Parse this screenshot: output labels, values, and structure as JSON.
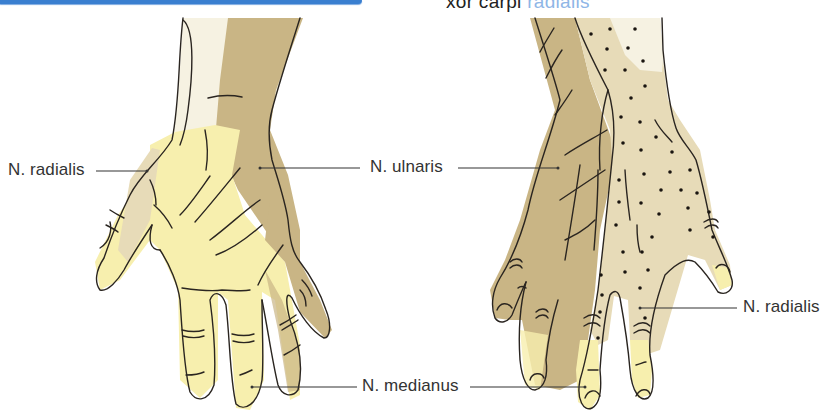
{
  "header": {
    "title_visible": "xor carpi ",
    "title_faded": "radialis"
  },
  "labels": {
    "left_radialis": "N. radialis",
    "ulnaris": "N. ulnaris",
    "medianus": "N. medianus",
    "right_radialis": "N. radialis"
  },
  "colors": {
    "accent_bar": "#3a7fd0",
    "medianus_zone": "#f7efae",
    "ulnaris_zone": "#c9b585",
    "radialis_zone": "#e7dbb8",
    "pale_zone": "#f6f2e2",
    "outline": "#2a2520"
  },
  "figures": [
    {
      "name": "palmar-view",
      "side": "left"
    },
    {
      "name": "dorsal-view",
      "side": "right"
    }
  ]
}
